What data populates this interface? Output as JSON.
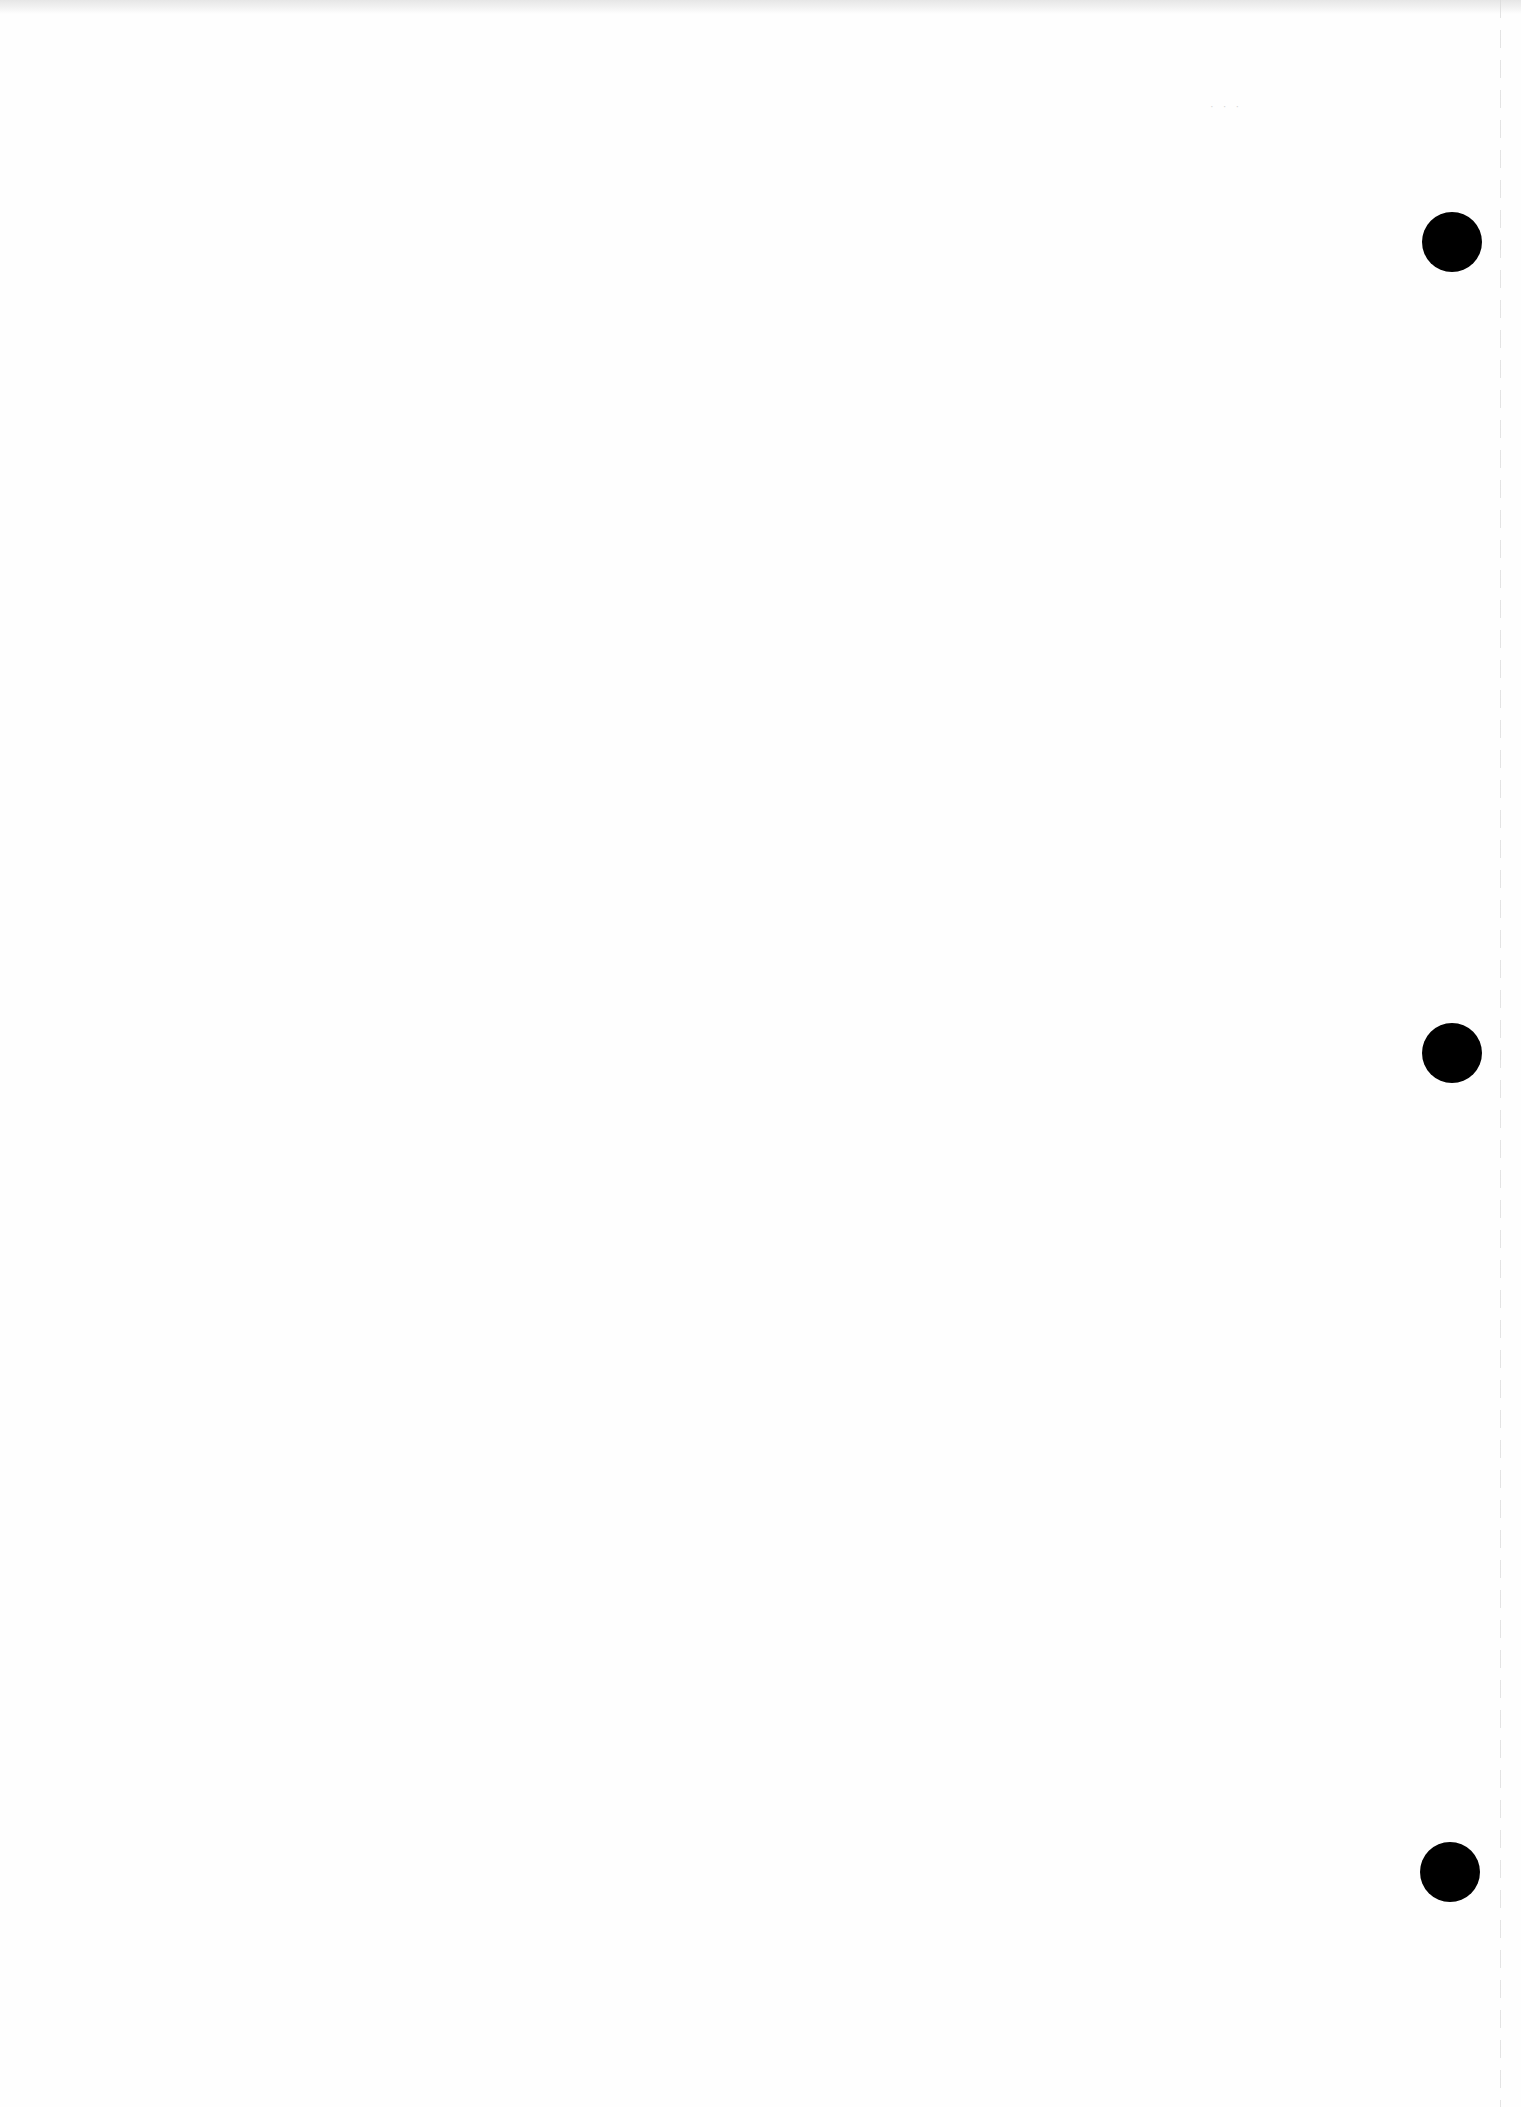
{
  "page": {
    "type": "blank-scanned-sheet",
    "background_color": "#fefefe",
    "hole_color": "#000000",
    "punch_holes": [
      {
        "cx": 1452,
        "cy": 242,
        "r": 30
      },
      {
        "cx": 1452,
        "cy": 1053,
        "r": 30
      },
      {
        "cx": 1450,
        "cy": 1872,
        "r": 30
      }
    ],
    "edge_line_x": 1500,
    "faint_bleed_text": "· · ·"
  }
}
